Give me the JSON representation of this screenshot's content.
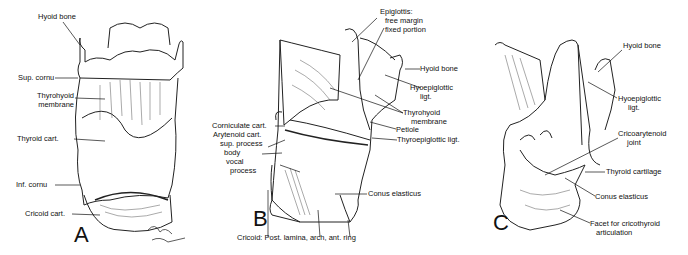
{
  "figure": {
    "panels": [
      {
        "letter": "A",
        "labels": {
          "hyoid_bone": "Hyoid bone",
          "sup_cornu": "Sup. cornu",
          "thyrohyoid_membrane_1": "Thyrohyoid",
          "thyrohyoid_membrane_2": "membrane",
          "thyroid_cart": "Thyroid cart.",
          "inf_cornu": "Inf. cornu",
          "cricoid_cart": "Cricoid cart."
        },
        "signature": "George Schott"
      },
      {
        "letter": "B",
        "labels": {
          "epiglottis": "Epiglottis:",
          "free_margin": "free margin",
          "fixed_portion": "fixed portion",
          "hyoid_bone": "Hyoid bone",
          "hyoepiglottic_1": "Hyoepiglottic",
          "hyoepiglottic_2": "ligt.",
          "thyrohyoid_1": "Thyrohyoid",
          "thyrohyoid_2": "membrane",
          "petiole": "Petiole",
          "thyroepiglottic": "Thyroepiglottic ligt.",
          "corniculate": "Corniculate cart.",
          "arytenoid": "Arytenoid cart.",
          "sup_process": "sup. process",
          "body": "body",
          "vocal": "vocal",
          "process": "process",
          "conus": "Conus elasticus",
          "cricoid": "Cricoid: Post. lamina, arch, ant. ring"
        }
      },
      {
        "letter": "C",
        "labels": {
          "hyoid_bone": "Hyoid bone",
          "hyoepiglottic_1": "Hyoepiglottic",
          "hyoepiglottic_2": "ligt.",
          "cricoarytenoid_1": "Cricoarytenoid",
          "cricoarytenoid_2": "joint",
          "thyroid_cartilage": "Thyroid cartilage",
          "conus": "Conus elasticus",
          "facet_1": "Facet for cricothyroid",
          "facet_2": "articulation"
        }
      }
    ]
  }
}
